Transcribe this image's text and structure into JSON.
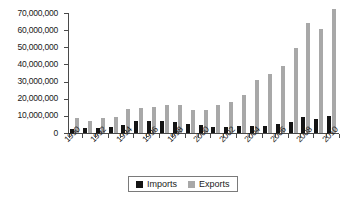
{
  "chart_data": {
    "type": "bar",
    "title": "",
    "subtitle": "",
    "xlabel": "",
    "ylabel": "",
    "categories": [
      "1990",
      "1991",
      "1992",
      "1993",
      "1994",
      "1995",
      "1996",
      "1997",
      "1998",
      "1999",
      "2000",
      "2001",
      "2002",
      "2003",
      "2004",
      "2005",
      "2006",
      "2007",
      "2008",
      "2009",
      "2010"
    ],
    "x_tick_labels": [
      "1990",
      "1992",
      "1994",
      "1996",
      "1998",
      "2000",
      "2002",
      "2004",
      "2006",
      "2008",
      "2010"
    ],
    "y_tick_labels": [
      "70,000,000",
      "60,000,000",
      "50,000,000",
      "40,000,000",
      "30,000,000",
      "20,000,000",
      "10,000,000",
      "0"
    ],
    "y_tick_values": [
      70000000,
      60000000,
      50000000,
      40000000,
      30000000,
      20000000,
      10000000,
      0
    ],
    "ylim": [
      0,
      70000000
    ],
    "grid": false,
    "legend_position": "bottom",
    "series": [
      {
        "name": "Imports",
        "color": "#141414",
        "values": [
          2500000,
          3000000,
          3200000,
          3800000,
          4700000,
          6800000,
          7200000,
          6900000,
          6500000,
          5000000,
          4600000,
          3700000,
          3800000,
          4100000,
          4300000,
          3900000,
          5400000,
          6200000,
          9200000,
          7900000,
          10000000
        ]
      },
      {
        "name": "Exports",
        "color": "#a8a8a8",
        "values": [
          9000000,
          7200000,
          8800000,
          9100000,
          14300000,
          14500000,
          14900000,
          16200000,
          16600000,
          13400000,
          13500000,
          16200000,
          18100000,
          22400000,
          30700000,
          34700000,
          38900000,
          49500000,
          64000000,
          60800000,
          72500000
        ]
      }
    ]
  },
  "legend": {
    "entries": [
      {
        "label": "Imports",
        "swatch": "black-square-swatch"
      },
      {
        "label": "Exports",
        "swatch": "gray-square-swatch"
      }
    ]
  }
}
